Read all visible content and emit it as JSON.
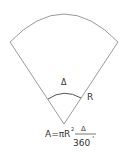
{
  "diagram": {
    "type": "circular-sector",
    "angle_label": "Δ",
    "radius_label": "R",
    "formula": {
      "lhs": "A=πR",
      "exponent": "2",
      "fraction_numerator": "Δ",
      "fraction_denominator": "360",
      "degree_symbol": "°"
    },
    "colors": {
      "sector_stroke": "#9a9a9a",
      "arc_stroke": "#555555",
      "text": "#333333"
    }
  }
}
